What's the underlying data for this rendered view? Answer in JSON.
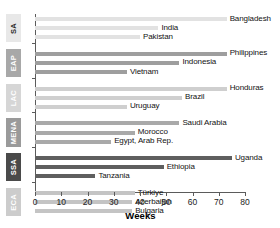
{
  "chart_data": {
    "type": "bar",
    "orientation": "horizontal",
    "title": "",
    "subtitle": "",
    "xlabel": "Weeks",
    "ylabel": "",
    "xlim": [
      0,
      80
    ],
    "xticks": [
      0,
      10,
      20,
      30,
      40,
      50,
      60,
      70,
      80
    ],
    "xtick_labels": [
      "0",
      "10",
      "20",
      "30",
      "40",
      "50",
      "60",
      "70",
      "80"
    ],
    "grid": false,
    "legend": "none",
    "categories": [
      "Bangladesh",
      "India",
      "Pakistan",
      "Philippines",
      "Indonesia",
      "Vietnam",
      "Honduras",
      "Brazil",
      "Uruguay",
      "Saudi Arabia",
      "Morocco",
      "Egypt, Arab Rep.",
      "Uganda",
      "Ethiopia",
      "Tanzania",
      "Türkiye",
      "Azerbaijan",
      "Bulgaria"
    ],
    "values": [
      73,
      47,
      40,
      73,
      55,
      35,
      73,
      56,
      35,
      55,
      38,
      29,
      75,
      49,
      23,
      38,
      37,
      37
    ],
    "groups": [
      {
        "code": "SA",
        "name": "South Asia",
        "color": "#e2e2e2",
        "tab_bg": "#e8e8e8",
        "tab_fg": "#2b2b2b",
        "bars": [
          {
            "label": "Bangladesh",
            "value": 73
          },
          {
            "label": "India",
            "value": 47
          },
          {
            "label": "Pakistan",
            "value": 40
          }
        ]
      },
      {
        "code": "EAP",
        "name": "East Asia & Pacific",
        "color": "#9e9e9e",
        "tab_bg": "#a8a8a8",
        "tab_fg": "#ffffff",
        "bars": [
          {
            "label": "Philippines",
            "value": 73
          },
          {
            "label": "Indonesia",
            "value": 55
          },
          {
            "label": "Vietnam",
            "value": 35
          }
        ]
      },
      {
        "code": "LAC",
        "name": "Latin America & Caribbean",
        "color": "#cfcfcf",
        "tab_bg": "#d6d6d6",
        "tab_fg": "#ffffff",
        "bars": [
          {
            "label": "Honduras",
            "value": 73
          },
          {
            "label": "Brazil",
            "value": 56
          },
          {
            "label": "Uruguay",
            "value": 35
          }
        ]
      },
      {
        "code": "MENA",
        "name": "Middle East & North Africa",
        "color": "#a9a9a9",
        "tab_bg": "#9a9a9a",
        "tab_fg": "#ffffff",
        "bars": [
          {
            "label": "Saudi Arabia",
            "value": 55
          },
          {
            "label": "Morocco",
            "value": 38
          },
          {
            "label": "Egypt, Arab Rep.",
            "value": 29
          }
        ]
      },
      {
        "code": "SSA",
        "name": "Sub-Saharan Africa",
        "color": "#5f5f5f",
        "tab_bg": "#4a4a4a",
        "tab_fg": "#ffffff",
        "bars": [
          {
            "label": "Uganda",
            "value": 75
          },
          {
            "label": "Ethiopia",
            "value": 49
          },
          {
            "label": "Tanzania",
            "value": 23
          }
        ]
      },
      {
        "code": "ECA",
        "name": "Europe & Central Asia",
        "color": "#c4c4c4",
        "tab_bg": "#cccccc",
        "tab_fg": "#ffffff",
        "bars": [
          {
            "label": "Türkiye",
            "value": 38
          },
          {
            "label": "Azerbaijan",
            "value": 37
          },
          {
            "label": "Bulgaria",
            "value": 37
          }
        ]
      }
    ]
  }
}
